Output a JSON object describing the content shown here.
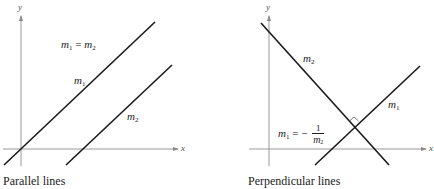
{
  "panels": [
    {
      "id": "parallel",
      "caption": "Parallel lines",
      "axis_x_label": "x",
      "axis_y_label": "y",
      "relation": {
        "lhs_var": "m",
        "lhs_sub": "1",
        "op": "=",
        "rhs_var": "m",
        "rhs_sub": "2"
      },
      "line1_label": {
        "var": "m",
        "sub": "1"
      },
      "line2_label": {
        "var": "m",
        "sub": "2"
      }
    },
    {
      "id": "perpendicular",
      "caption": "Perpendicular lines",
      "axis_x_label": "x",
      "axis_y_label": "y",
      "relation": {
        "lhs_var": "m",
        "lhs_sub": "1",
        "op": "= −",
        "num": "1",
        "den_var": "m",
        "den_sub": "2"
      },
      "line1_label": {
        "var": "m",
        "sub": "1"
      },
      "line2_label": {
        "var": "m",
        "sub": "2"
      }
    }
  ],
  "colors": {
    "line": "#1a1a1a",
    "axis": "#9a9a9a",
    "text": "#222222"
  }
}
